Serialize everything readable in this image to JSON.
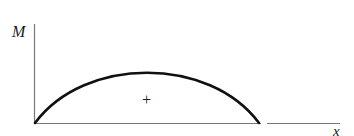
{
  "diagram": {
    "y_axis_label": "M",
    "x_axis_label": "x",
    "region_sign": "+",
    "curve": {
      "shape": "arc",
      "start": [
        35,
        123
      ],
      "peak": [
        147,
        73
      ],
      "end": [
        259,
        123
      ]
    },
    "colors": {
      "curve": "#111111",
      "axis": "#777777",
      "text": "#1a1a1a",
      "background": "#ffffff"
    }
  }
}
